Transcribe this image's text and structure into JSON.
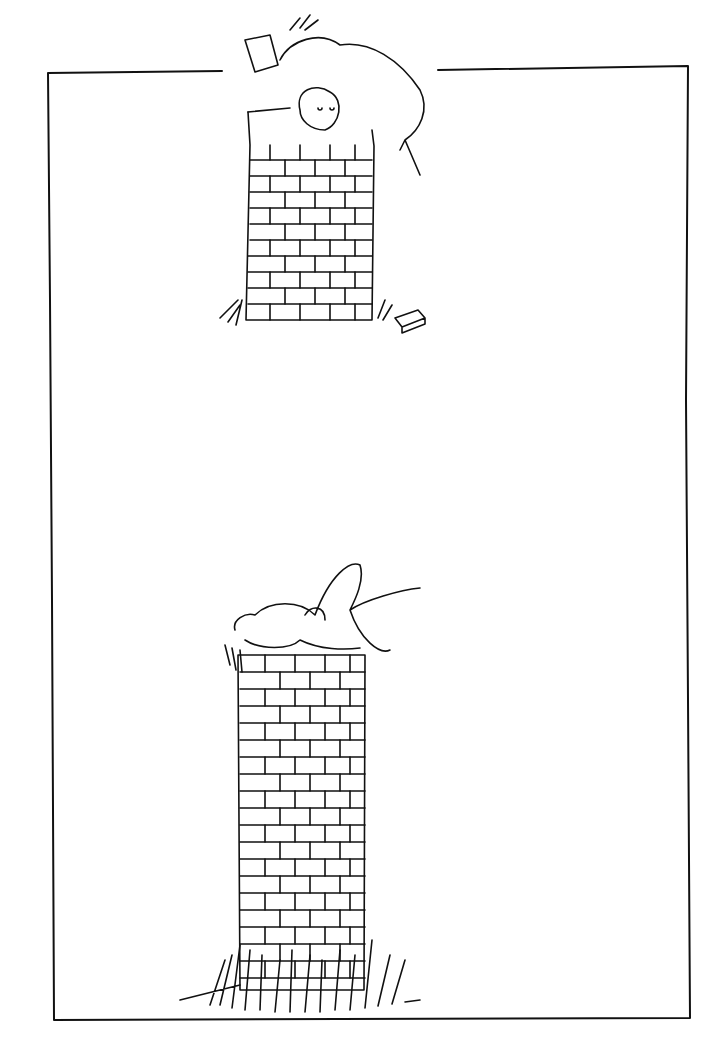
{
  "illustration": {
    "style": "pen-and-ink line drawing",
    "colors": {
      "ink": "#111111",
      "paper": "#ffffff"
    },
    "panels": [
      {
        "id": "top",
        "subject": "two figures atop a short brick chimney; one holds a brick"
      },
      {
        "id": "bottom",
        "subject": "a figure lying on top of a tall brick column surrounded by grass"
      }
    ]
  }
}
